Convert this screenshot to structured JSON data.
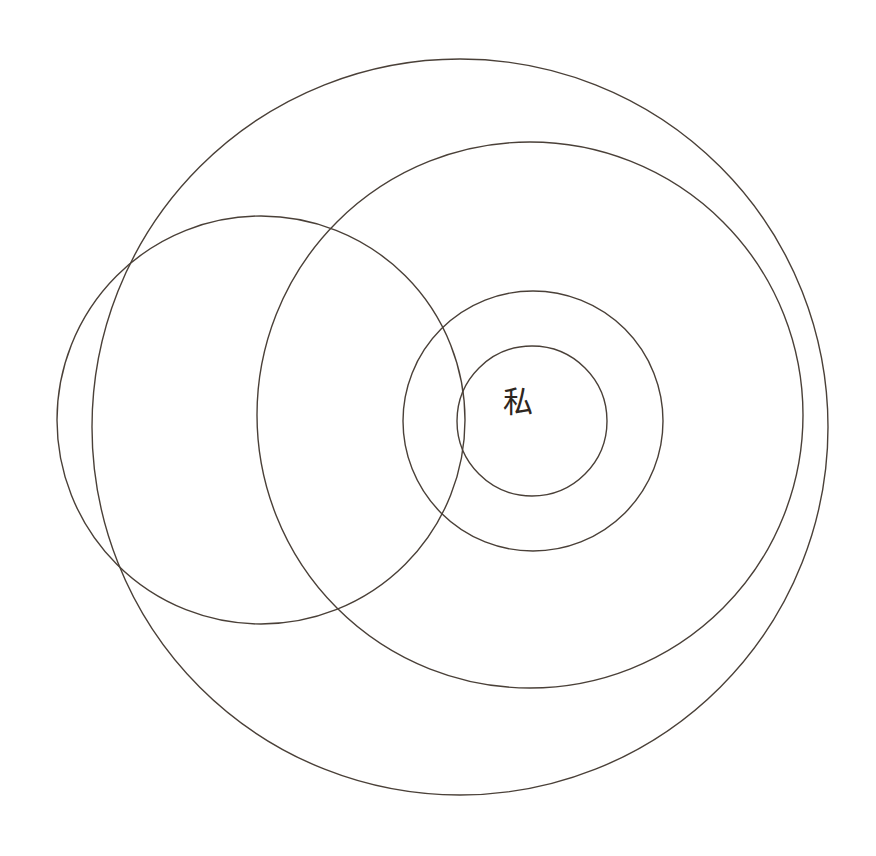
{
  "canvas": {
    "width": 876,
    "height": 856,
    "background_color": "#ffffff"
  },
  "style": {
    "stroke_color": "#4a4038",
    "stroke_width": 1.4,
    "glyph_color": "#2e2620"
  },
  "diagram": {
    "type": "concentric-circles",
    "title": "",
    "center_label": {
      "text": "私",
      "reading": "watashi",
      "meaning": "I / me / self",
      "x": 518,
      "y": 401,
      "font_size": 30,
      "color": "#2e2620"
    },
    "circles": [
      {
        "name": "outermost-circle",
        "label": "",
        "cx": 460,
        "cy": 427,
        "r": 368,
        "stroke": "#4a4038",
        "stroke_width": 1.4
      },
      {
        "name": "second-circle",
        "label": "",
        "cx": 530,
        "cy": 415,
        "r": 273,
        "stroke": "#4a4038",
        "stroke_width": 1.4
      },
      {
        "name": "left-large-circle",
        "label": "",
        "cx": 261,
        "cy": 420,
        "r": 204,
        "stroke": "#4a4038",
        "stroke_width": 1.4
      },
      {
        "name": "third-circle",
        "label": "",
        "cx": 533,
        "cy": 421,
        "r": 130,
        "stroke": "#4a4038",
        "stroke_width": 1.4
      },
      {
        "name": "innermost-circle",
        "label": "",
        "cx": 532,
        "cy": 421,
        "r": 75,
        "stroke": "#4a4038",
        "stroke_width": 1.4
      }
    ]
  }
}
